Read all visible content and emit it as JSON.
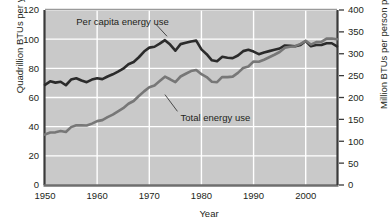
{
  "chart_data": {
    "type": "line",
    "title": "",
    "xlabel": "Year",
    "ylabel_left": "Quadrillion BTUs per year",
    "ylabel_right": "Million BTUs per person per year",
    "xlim": [
      1950,
      2006
    ],
    "xticks": [
      1950,
      1960,
      1970,
      1980,
      1990,
      2000
    ],
    "xticklabels": [
      "1950",
      "1960",
      "1970",
      "1980",
      "1990",
      "2000"
    ],
    "ylim_left": [
      0,
      120
    ],
    "yticks_left": [
      0,
      20,
      40,
      60,
      80,
      100,
      120
    ],
    "yticklabels_left": [
      "0",
      "20",
      "40",
      "60",
      "80",
      "100",
      "120"
    ],
    "ylim_right": [
      0,
      400
    ],
    "yticks_right": [
      0,
      50,
      100,
      150,
      200,
      250,
      300,
      350,
      400
    ],
    "yticklabels_right": [
      "0",
      "50",
      "100",
      "150",
      "200",
      "250",
      "300",
      "350",
      "400"
    ],
    "grid": true,
    "plot_bg": "#c9c9c9",
    "grid_color": "#ffffff",
    "legend_position": "inline-annotations",
    "annotations": [
      {
        "text": "Per capita energy use",
        "x": 1956,
        "y": 112
      },
      {
        "text": "Total energy use",
        "x": 1976,
        "y": 46
      }
    ],
    "series": [
      {
        "name": "Per capita energy use",
        "axis": "right",
        "color": "#2b2b2b",
        "unit": "Million BTUs per person per year",
        "x": [
          1950,
          1951,
          1952,
          1953,
          1954,
          1955,
          1956,
          1957,
          1958,
          1959,
          1960,
          1961,
          1962,
          1963,
          1964,
          1965,
          1966,
          1967,
          1968,
          1969,
          1970,
          1971,
          1972,
          1973,
          1974,
          1975,
          1976,
          1977,
          1978,
          1979,
          1980,
          1981,
          1982,
          1983,
          1984,
          1985,
          1986,
          1987,
          1988,
          1989,
          1990,
          1991,
          1992,
          1993,
          1994,
          1995,
          1996,
          1997,
          1998,
          1999,
          2000,
          2001,
          2002,
          2003,
          2004,
          2005,
          2006
        ],
        "y": [
          229,
          237,
          234,
          236,
          228,
          241,
          244,
          239,
          235,
          241,
          244,
          242,
          248,
          253,
          259,
          266,
          276,
          281,
          292,
          305,
          314,
          316,
          323,
          331,
          321,
          307,
          322,
          325,
          328,
          330,
          310,
          299,
          285,
          283,
          293,
          291,
          290,
          296,
          306,
          309,
          305,
          299,
          303,
          306,
          309,
          312,
          319,
          318,
          317,
          320,
          329,
          317,
          320,
          320,
          324,
          324,
          317
        ]
      },
      {
        "name": "Total energy use",
        "axis": "left",
        "color": "#777777",
        "unit": "Quadrillion BTUs per year",
        "x": [
          1950,
          1951,
          1952,
          1953,
          1954,
          1955,
          1956,
          1957,
          1958,
          1959,
          1960,
          1961,
          1962,
          1963,
          1964,
          1965,
          1966,
          1967,
          1968,
          1969,
          1970,
          1971,
          1972,
          1973,
          1974,
          1975,
          1976,
          1977,
          1978,
          1979,
          1980,
          1981,
          1982,
          1983,
          1984,
          1985,
          1986,
          1987,
          1988,
          1989,
          1990,
          1991,
          1992,
          1993,
          1994,
          1995,
          1996,
          1997,
          1998,
          1999,
          2000,
          2001,
          2002,
          2003,
          2004,
          2005,
          2006
        ],
        "y": [
          34.6,
          36.0,
          36.1,
          37.0,
          36.3,
          39.7,
          41.0,
          40.9,
          40.8,
          42.1,
          43.8,
          44.5,
          46.5,
          48.3,
          50.5,
          52.7,
          55.7,
          57.6,
          61.0,
          64.2,
          67.1,
          68.3,
          71.3,
          74.3,
          72.5,
          70.5,
          74.4,
          76.3,
          78.1,
          78.9,
          76.0,
          74.0,
          70.8,
          70.5,
          74.1,
          74.0,
          74.3,
          76.9,
          80.2,
          81.3,
          84.7,
          84.5,
          85.9,
          87.6,
          89.3,
          91.2,
          94.2,
          94.8,
          95.2,
          96.8,
          98.9,
          96.3,
          98.0,
          98.2,
          100.4,
          100.5,
          99.9
        ]
      }
    ]
  }
}
